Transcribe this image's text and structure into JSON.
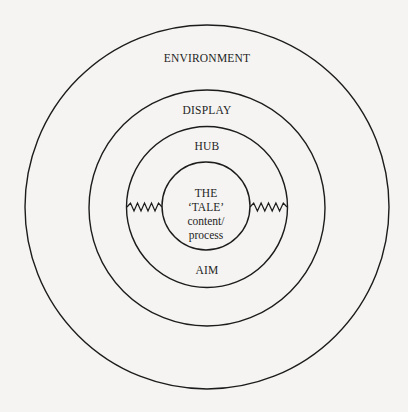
{
  "diagram": {
    "type": "concentric-circles",
    "layers": [
      {
        "id": "environment",
        "label": "ENVIRONMENT"
      },
      {
        "id": "display",
        "label": "DISPLAY"
      },
      {
        "id": "hub",
        "label": "HUB",
        "bottom_label": "AIM"
      },
      {
        "id": "core",
        "lines": [
          "THE",
          "‘TALE’",
          "content/",
          "process"
        ]
      }
    ],
    "connectors": [
      {
        "id": "left-zigzag",
        "from": "hub",
        "to": "core",
        "style": "zigzag"
      },
      {
        "id": "right-zigzag",
        "from": "core",
        "to": "hub",
        "style": "zigzag"
      }
    ],
    "colors": {
      "background": "#f5f4f2",
      "stroke": "#1c1c1c",
      "text": "#1e1e1e"
    }
  }
}
